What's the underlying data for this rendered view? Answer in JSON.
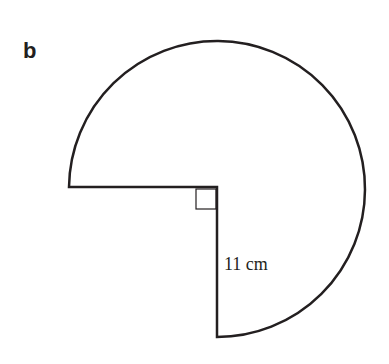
{
  "figure": {
    "label": "b",
    "shape": "three-quarter circle (sector with 270° arc)",
    "radius_label": "11 cm",
    "right_angle_marker": true
  },
  "colors": {
    "stroke": "#231f20",
    "background": "#ffffff"
  }
}
